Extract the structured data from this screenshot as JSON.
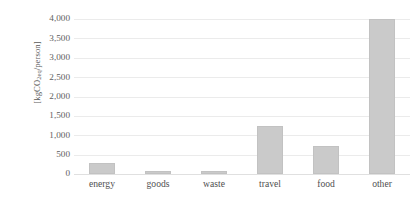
{
  "chart_data": {
    "type": "bar",
    "title": "",
    "xlabel": "",
    "ylabel": "[kgCO2eq/person]",
    "ylabel_parts": {
      "prefix": "[kgCO",
      "sub1": "2",
      "mid": "",
      "sub2": "eq",
      "suffix": "/person]"
    },
    "categories": [
      "energy",
      "goods",
      "waste",
      "travel",
      "food",
      "other"
    ],
    "values": [
      280,
      90,
      80,
      1250,
      720,
      3990
    ],
    "ylim": [
      0,
      4000
    ],
    "yticks": [
      0,
      500,
      1000,
      1500,
      2000,
      2500,
      3000,
      3500,
      4000
    ],
    "ytick_labels": [
      "0",
      "500",
      "1,000",
      "1,500",
      "2,000",
      "2,500",
      "3,000",
      "3,500",
      "4,000"
    ],
    "grid": true,
    "legend": "none",
    "bar_color": "#cacaca",
    "gridline_color": "#ebebeb",
    "axis_text_color": "#5e5e5e",
    "background_color": "#ffffff"
  }
}
